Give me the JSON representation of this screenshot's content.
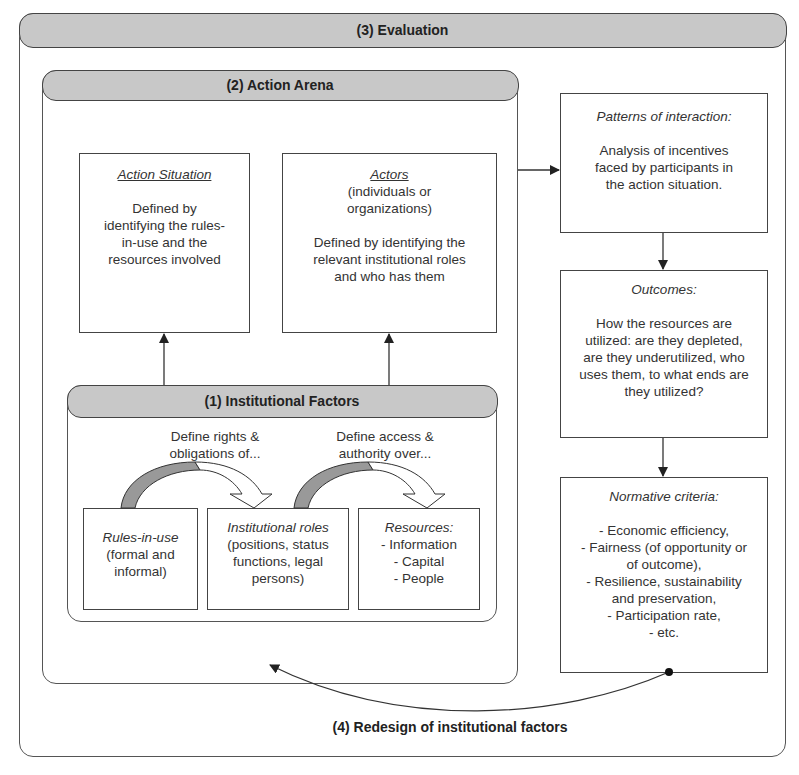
{
  "evaluation": {
    "title": "(3) Evaluation"
  },
  "action_arena": {
    "title": "(2) Action Arena"
  },
  "action_situation": {
    "title": "Action Situation",
    "lines": [
      "Defined by",
      "identifying the rules-",
      "in-use and the",
      "resources involved"
    ]
  },
  "actors": {
    "title": "Actors",
    "subtitle": [
      "(individuals or",
      "organizations)"
    ],
    "lines": [
      "Defined by identifying the",
      "relevant institutional roles",
      "and who has them"
    ]
  },
  "institutional_factors": {
    "title": "(1) Institutional Factors",
    "label_left": [
      "Define rights &",
      "obligations of..."
    ],
    "label_right": [
      "Define access &",
      "authority over..."
    ],
    "rules": {
      "title": "Rules-in-use",
      "lines": [
        "(formal and",
        "informal)"
      ]
    },
    "roles": {
      "title": "Institutional roles",
      "lines": [
        "(positions, status",
        "functions, legal",
        "persons)"
      ]
    },
    "resources": {
      "title": "Resources:",
      "lines": [
        "- Information",
        "- Capital",
        "- People"
      ]
    }
  },
  "patterns": {
    "title": "Patterns of interaction:",
    "lines": [
      "Analysis of incentives",
      "faced by participants in",
      "the action situation."
    ]
  },
  "outcomes": {
    "title": "Outcomes:",
    "lines": [
      "How the resources are",
      "utilized: are they depleted,",
      "are they underutilized, who",
      "uses them, to what ends are",
      "they utilized?"
    ]
  },
  "normative": {
    "title": "Normative criteria:",
    "lines": [
      "- Economic efficiency,",
      "- Fairness (of opportunity or",
      "of outcome),",
      "- Resilience, sustainability",
      "and preservation,",
      "- Participation rate,",
      "- etc."
    ]
  },
  "redesign": {
    "title": "(4) Redesign of institutional factors"
  },
  "colors": {
    "header_fill": "#c8c8c8",
    "stroke": "#444444",
    "arrow_dark": "#888888"
  }
}
